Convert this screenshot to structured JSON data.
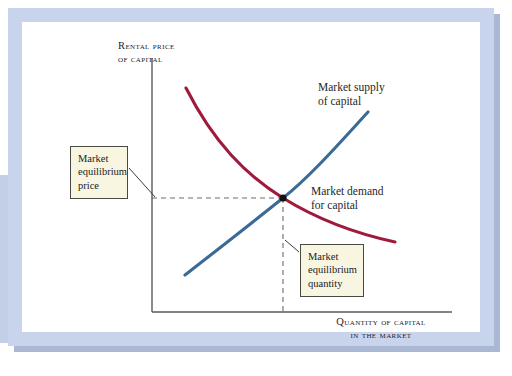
{
  "figure": {
    "type": "supply-demand-diagram",
    "axes": {
      "y_label": "Rental price\nof capital",
      "x_label": "Quantity of capital\nin the market"
    },
    "curves": {
      "supply": {
        "label": "Market supply\nof capital",
        "color": "#3a6b96",
        "slope": "upward"
      },
      "demand": {
        "label": "Market demand\nfor capital",
        "color": "#9e1b3c",
        "slope": "downward"
      }
    },
    "callouts": {
      "price": "Market\nequilibrium\nprice",
      "quantity": "Market\nequilibrium\nquantity"
    },
    "equilibrium": {
      "marker_color": "#111111",
      "guide_color": "#6b6b6b"
    },
    "colors": {
      "frame": "#c8d4ec",
      "frame_shadow": "#aab8d4",
      "callout_fill": "#f8f6e1",
      "axis": "#5a5a5f",
      "page": "#ffffff"
    }
  }
}
